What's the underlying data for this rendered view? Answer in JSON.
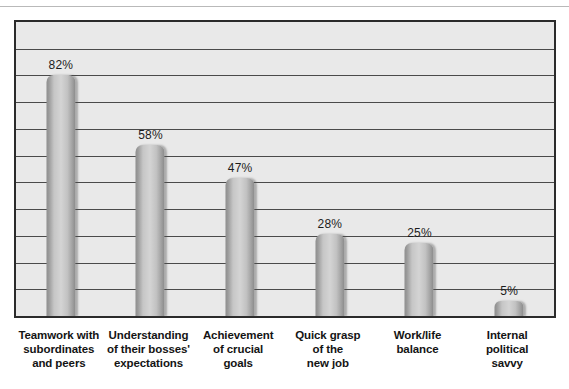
{
  "chart_data": {
    "type": "bar",
    "title": "",
    "xlabel": "",
    "ylabel": "",
    "ylim": [
      0,
      100
    ],
    "grid": true,
    "legend": false,
    "gridline_count": 10,
    "categories": [
      "Teamwork with subordinates and peers",
      "Understanding of their bosses' expectations",
      "Achievement of crucial goals",
      "Quick grasp of the new job",
      "Work/life balance",
      "Internal political savvy"
    ],
    "values": [
      82,
      58,
      47,
      28,
      25,
      5
    ],
    "value_labels": [
      "82%",
      "58%",
      "47%",
      "28%",
      "25%",
      "5%"
    ],
    "category_lines": [
      [
        "Teamwork with",
        "subordinates",
        "and peers"
      ],
      [
        "Understanding",
        "of their bosses'",
        "expectations"
      ],
      [
        "Achievement",
        "of crucial",
        "goals"
      ],
      [
        "Quick grasp",
        "of the",
        "new job"
      ],
      [
        "Work/life",
        "balance"
      ],
      [
        "Internal",
        "political",
        "savvy"
      ]
    ]
  },
  "style": {
    "plot_background": "#e9e9e9",
    "plot_border": "#2b2b2b",
    "gridline_color": "#4a4a4a",
    "bar_light": "#d4d4d4",
    "bar_dark": "#8a8a8a",
    "label_color": "#141414",
    "value_color": "#1c1c1c",
    "page_background": "#ffffff"
  },
  "top_strip": {
    "text": ""
  }
}
